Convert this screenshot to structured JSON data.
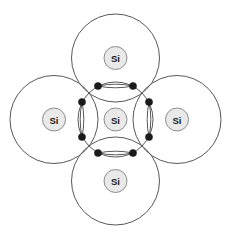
{
  "diagram": {
    "type": "atomic-bond-diagram",
    "background_color": "#ffffff",
    "shell_stroke_color": "#58585a",
    "nucleus_fill_color": "#e9e9e9",
    "nucleus_stroke_color": "#8d8d8d",
    "electron_dot_color": "#1a1a1a",
    "label_color": "#1a1a1a",
    "canvas": {
      "width": 231,
      "height": 239
    },
    "atoms": [
      {
        "id": "center",
        "label": "Si",
        "position": "center",
        "shell_cx": 115.5,
        "shell_cy": 119.5,
        "shell_r": 37.5,
        "nucleus_r": 11.5
      },
      {
        "id": "top",
        "label": "Si",
        "position": "top",
        "shell_cx": 115.5,
        "shell_cy": 58.0,
        "shell_r": 44.0,
        "nucleus_r": 11.5
      },
      {
        "id": "bottom",
        "label": "Si",
        "position": "bottom",
        "shell_cx": 115.5,
        "shell_cy": 181.0,
        "shell_r": 44.0,
        "nucleus_r": 11.5
      },
      {
        "id": "left",
        "label": "Si",
        "position": "left",
        "shell_cx": 54.0,
        "shell_cy": 119.5,
        "shell_r": 44.0,
        "nucleus_r": 11.5
      },
      {
        "id": "right",
        "label": "Si",
        "position": "right",
        "shell_cx": 177.0,
        "shell_cy": 119.5,
        "shell_r": 44.0,
        "nucleus_r": 11.5
      }
    ],
    "bonds": [
      {
        "id": "bond-top",
        "orientation": "horizontal",
        "between": [
          "center",
          "top"
        ],
        "electron_count": 2,
        "cx": 115.5,
        "cy": 86.0,
        "half_length": 17.5,
        "half_width": 3.6,
        "dots": [
          {
            "cx": 98.0,
            "cy": 86.0,
            "r": 3.6
          },
          {
            "cx": 133.0,
            "cy": 86.0,
            "r": 3.6
          }
        ]
      },
      {
        "id": "bond-bottom",
        "orientation": "horizontal",
        "between": [
          "center",
          "bottom"
        ],
        "electron_count": 2,
        "cx": 115.5,
        "cy": 153.0,
        "half_length": 17.5,
        "half_width": 3.6,
        "dots": [
          {
            "cx": 98.0,
            "cy": 153.0,
            "r": 3.6
          },
          {
            "cx": 133.0,
            "cy": 153.0,
            "r": 3.6
          }
        ]
      },
      {
        "id": "bond-left",
        "orientation": "vertical",
        "between": [
          "center",
          "left"
        ],
        "electron_count": 2,
        "cx": 82.0,
        "cy": 119.5,
        "half_length": 17.5,
        "half_width": 3.6,
        "dots": [
          {
            "cx": 82.0,
            "cy": 102.0,
            "r": 3.6
          },
          {
            "cx": 82.0,
            "cy": 137.0,
            "r": 3.6
          }
        ]
      },
      {
        "id": "bond-right",
        "orientation": "vertical",
        "between": [
          "center",
          "right"
        ],
        "electron_count": 2,
        "cx": 149.0,
        "cy": 119.5,
        "half_length": 17.5,
        "half_width": 3.6,
        "dots": [
          {
            "cx": 149.0,
            "cy": 102.0,
            "r": 3.6
          },
          {
            "cx": 149.0,
            "cy": 137.0,
            "r": 3.6
          }
        ]
      }
    ]
  }
}
